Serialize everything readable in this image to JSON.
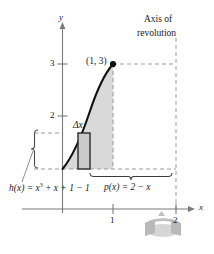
{
  "figure": {
    "type": "shell-method-diagram",
    "axes": {
      "y_axis_label": "y",
      "x_axis_label": "x",
      "y_ticks": [
        {
          "value": 2,
          "label": "2"
        },
        {
          "value": 3,
          "label": "3"
        }
      ],
      "x_ticks": [
        {
          "value": 1,
          "label": "1"
        },
        {
          "value": 2,
          "label": "2"
        }
      ]
    },
    "annotations": {
      "axis_of_revolution_line1": "Axis of",
      "axis_of_revolution_line2": "revolution",
      "point_label": "(1, 3)",
      "delta_x_label": "Δx",
      "p_of_x_label": "p(x) = 2 − x",
      "h_of_x_prefix": "h(x) = x",
      "h_of_x_exponent": "3",
      "h_of_x_suffix": " + x + 1 − 1"
    },
    "curve": {
      "expression": "x^3 + x + 1",
      "domain": [
        0,
        1
      ],
      "endpoint": {
        "x": 1,
        "y": 3
      }
    },
    "shaded_region": {
      "description": "region under curve from x=0 to x=1",
      "fill": "#d9d9d9"
    },
    "representative_rectangle": {
      "description": "representative shell element of width delta-x",
      "fill": "#c9c9c9",
      "stroke": "#2b2b2b"
    },
    "axis_of_revolution": {
      "x": 2,
      "style": "dashed"
    },
    "rotation_glyph": "revolution-arrow",
    "caption": ""
  },
  "colors": {
    "axis": "#7a7a7a",
    "curve": "#121212",
    "dashed": "#9b9b9b",
    "shade": "#d9d9d9",
    "rect_fill": "#c9c9c9",
    "rect_stroke": "#2b2b2b",
    "leader": "#8e8e8e"
  }
}
